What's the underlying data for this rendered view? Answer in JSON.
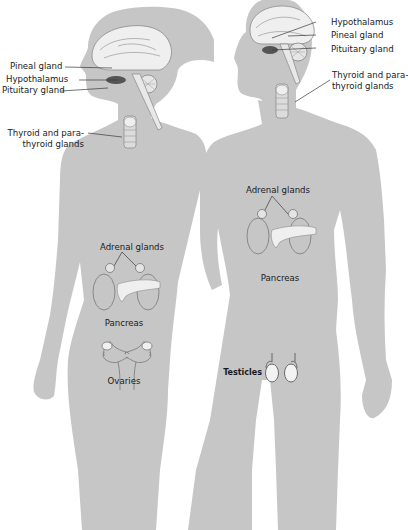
{
  "colors": {
    "silhouette": "#c6c6c6",
    "organ_fill": "#f2f2f2",
    "organ_stroke": "#6f6f6f",
    "leader_line": "#3a3a3a",
    "text": "#1a1a1a"
  },
  "female": {
    "labels": {
      "pineal": "Pineal gland",
      "hypothalamus": "Hypothalamus",
      "pituitary": "Pituitary gland",
      "thyroid_line1": "Thyroid and para-",
      "thyroid_line2": "thyroid glands",
      "adrenal": "Adrenal glands",
      "pancreas": "Pancreas",
      "ovaries": "Ovaries"
    }
  },
  "male": {
    "labels": {
      "hypothalamus": "Hypothalamus",
      "pineal": "Pineal gland",
      "pituitary": "Pituitary gland",
      "thyroid_line1": "Thyroid and para-",
      "thyroid_line2": "thyroid glands",
      "adrenal": "Adrenal glands",
      "pancreas": "Pancreas",
      "testicles": "Testicles"
    }
  }
}
